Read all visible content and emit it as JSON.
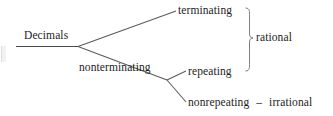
{
  "figure": {
    "root": {
      "label": "Decimals"
    },
    "branches": {
      "terminating": "terminating",
      "nonterminating": "nonterminating",
      "repeating": "repeating",
      "nonrepeating": "nonrepeating"
    },
    "grouping": {
      "brace_label": "rational"
    },
    "bottom_row": {
      "term": "nonrepeating",
      "separator": "–",
      "result": "irrational"
    },
    "colors": {
      "ink": "#1c1c1c",
      "line": "#555555",
      "background": "#ffffff"
    }
  }
}
